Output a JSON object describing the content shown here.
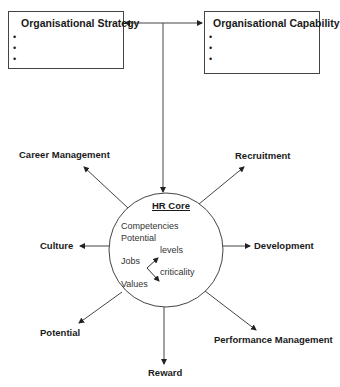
{
  "top_boxes": {
    "strategy": {
      "title": "Organisational Strategy",
      "bullets": [
        "•",
        "•",
        "•"
      ]
    },
    "capability": {
      "title": "Organisational Capability",
      "bullets": [
        "•",
        "•",
        "•"
      ]
    }
  },
  "core": {
    "title": "HR Core",
    "items": {
      "competencies": "Competencies",
      "potential": "Potential",
      "jobs": "Jobs",
      "levels": "levels",
      "criticality": "criticality",
      "values": "Values"
    }
  },
  "outputs": {
    "career_management": "Career Management",
    "recruitment": "Recruitment",
    "culture": "Culture",
    "development": "Development",
    "potential": "Potential",
    "performance_management": "Performance Management",
    "reward": "Reward"
  },
  "colors": {
    "line": "#444444",
    "text": "#1a1a1a",
    "background": "#ffffff"
  }
}
